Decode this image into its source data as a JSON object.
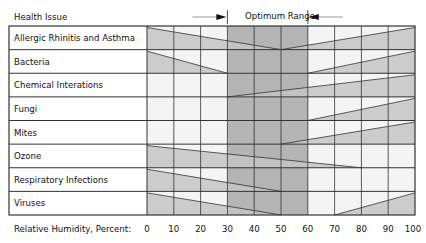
{
  "chart_data": {
    "type": "table",
    "title": "Optimum Range",
    "header_label": "Health Issue",
    "xlabel": "Relative Humidity, Percent:",
    "x_ticks": [
      0,
      10,
      20,
      30,
      40,
      50,
      60,
      70,
      80,
      90,
      100
    ],
    "xlim": [
      0,
      100
    ],
    "optimum_range": [
      30,
      60
    ],
    "grid": true,
    "rows": [
      {
        "label": "Allergic Rhinitis and Asthma",
        "left_wedge_end": 50,
        "right_wedge_start": 50
      },
      {
        "label": "Bacteria",
        "left_wedge_end": 30,
        "right_wedge_start": 60
      },
      {
        "label": "Chemical Interations",
        "left_wedge_end": null,
        "right_wedge_start": 30
      },
      {
        "label": "Fungi",
        "left_wedge_end": null,
        "right_wedge_start": 60
      },
      {
        "label": "Mites",
        "left_wedge_end": null,
        "right_wedge_start": 50
      },
      {
        "label": "Ozone",
        "left_wedge_end": 80,
        "right_wedge_start": null
      },
      {
        "label": "Respiratory Infections",
        "left_wedge_end": 50,
        "right_wedge_start": null
      },
      {
        "label": "Viruses",
        "left_wedge_end": 50,
        "right_wedge_start": 70
      }
    ]
  },
  "colors": {
    "cell_background": "#f4f4f4",
    "optimum_band": "#b4b4b4",
    "wedge": "#c4c4c4",
    "grid": "#333333"
  }
}
